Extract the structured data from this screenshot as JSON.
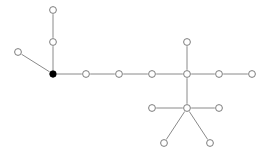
{
  "graph": {
    "title": "Node Link Graph",
    "background_color": "#ffffff",
    "edge_color": "#8a8a8a",
    "node_stroke_color": "#7d7d7d",
    "node_fill_color": "#ffffff",
    "highlight_node_color": "#000000",
    "node_radius": 3.4,
    "filled_node_radius": 3.2,
    "node_count": 16,
    "edge_count": 15,
    "nodes": [
      {
        "id": "n0",
        "label": "",
        "x": 53,
        "y": 10,
        "style": "open",
        "name": "node-top-branch-end"
      },
      {
        "id": "n1",
        "label": "",
        "x": 53,
        "y": 42,
        "style": "open",
        "name": "node-top-branch-mid"
      },
      {
        "id": "n2",
        "label": "",
        "x": 18,
        "y": 52,
        "style": "open",
        "name": "node-left-branch-end"
      },
      {
        "id": "n3",
        "label": "",
        "x": 53,
        "y": 74,
        "style": "filled",
        "name": "node-highlighted-hub"
      },
      {
        "id": "n4",
        "label": "",
        "x": 86,
        "y": 74,
        "style": "open",
        "name": "node-chain-1"
      },
      {
        "id": "n5",
        "label": "",
        "x": 119,
        "y": 74,
        "style": "open",
        "name": "node-chain-2"
      },
      {
        "id": "n6",
        "label": "",
        "x": 152,
        "y": 74,
        "style": "open",
        "name": "node-chain-3"
      },
      {
        "id": "n7",
        "label": "",
        "x": 187,
        "y": 74,
        "style": "open",
        "name": "node-upper-hub"
      },
      {
        "id": "n8",
        "label": "",
        "x": 187,
        "y": 42,
        "style": "open",
        "name": "node-upper-hub-top"
      },
      {
        "id": "n9",
        "label": "",
        "x": 219,
        "y": 74,
        "style": "open",
        "name": "node-chain-4"
      },
      {
        "id": "n10",
        "label": "",
        "x": 252,
        "y": 74,
        "style": "open",
        "name": "node-chain-end"
      },
      {
        "id": "n11",
        "label": "",
        "x": 187,
        "y": 108,
        "style": "open",
        "name": "node-lower-hub"
      },
      {
        "id": "n12",
        "label": "",
        "x": 152,
        "y": 108,
        "style": "open",
        "name": "node-lower-hub-left"
      },
      {
        "id": "n13",
        "label": "",
        "x": 219,
        "y": 108,
        "style": "open",
        "name": "node-lower-hub-right"
      },
      {
        "id": "n14",
        "label": "",
        "x": 164,
        "y": 143,
        "style": "open",
        "name": "node-lower-leaf-left"
      },
      {
        "id": "n15",
        "label": "",
        "x": 210,
        "y": 143,
        "style": "open",
        "name": "node-lower-leaf-right"
      }
    ],
    "edges": [
      {
        "source": "n0",
        "target": "n1"
      },
      {
        "source": "n1",
        "target": "n3"
      },
      {
        "source": "n2",
        "target": "n3"
      },
      {
        "source": "n3",
        "target": "n4"
      },
      {
        "source": "n4",
        "target": "n5"
      },
      {
        "source": "n5",
        "target": "n6"
      },
      {
        "source": "n6",
        "target": "n7"
      },
      {
        "source": "n7",
        "target": "n8"
      },
      {
        "source": "n7",
        "target": "n9"
      },
      {
        "source": "n9",
        "target": "n10"
      },
      {
        "source": "n7",
        "target": "n11"
      },
      {
        "source": "n11",
        "target": "n12"
      },
      {
        "source": "n11",
        "target": "n13"
      },
      {
        "source": "n11",
        "target": "n14"
      },
      {
        "source": "n11",
        "target": "n15"
      }
    ]
  }
}
